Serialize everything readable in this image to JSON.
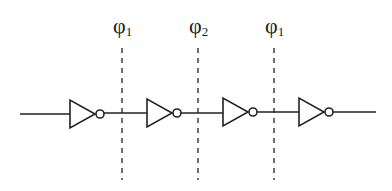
{
  "diagram": {
    "phase_labels": [
      {
        "symbol": "φ",
        "subscript": "1",
        "x": 122
      },
      {
        "symbol": "φ",
        "subscript": "2",
        "x": 198
      },
      {
        "symbol": "φ",
        "subscript": "1",
        "x": 274
      }
    ],
    "inverters": [
      {
        "x": 70
      },
      {
        "x": 147
      },
      {
        "x": 223
      },
      {
        "x": 299
      }
    ],
    "wire": {
      "y": 114,
      "start_x": 20,
      "end_x": 376
    },
    "colors": {
      "stroke": "#222222",
      "background": "#ffffff"
    }
  }
}
